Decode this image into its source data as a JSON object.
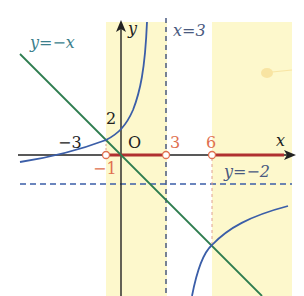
{
  "diagram": {
    "type": "function-graph",
    "axes": {
      "x_label": "x",
      "y_label": "y",
      "origin_label": "O"
    },
    "curves": [
      {
        "name": "hyperbola",
        "equation": "y = -2 - 12/(x-3)",
        "color": "#3b5ea8"
      },
      {
        "name": "line",
        "equation": "y = -x",
        "label": "y=−x",
        "color": "#2e7d4f"
      }
    ],
    "asymptotes": [
      {
        "label": "x=3",
        "type": "vertical",
        "value": 3
      },
      {
        "label": "y=−2",
        "type": "horizontal",
        "value": -2
      }
    ],
    "tick_labels": {
      "y_intercept": "2",
      "x_intercept": "−3",
      "red_points": [
        "−1",
        "3",
        "6"
      ]
    },
    "shaded_intervals": [
      [
        -1,
        3
      ],
      [
        6,
        "∞"
      ]
    ],
    "colors": {
      "shade": "#fdf8cc",
      "highlight": "#b03030",
      "point": "#e07050",
      "axis": "#222222"
    }
  }
}
